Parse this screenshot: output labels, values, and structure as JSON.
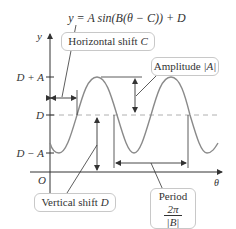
{
  "equation": "y = A sin(B(θ − C)) + D",
  "axes": {
    "y_label": "y",
    "x_label": "θ",
    "origin_label": "O",
    "ticks": [
      {
        "label": "D + A",
        "level": "max"
      },
      {
        "label": "D",
        "level": "midline"
      },
      {
        "label": "D − A",
        "level": "min"
      }
    ]
  },
  "callouts": {
    "horizontal_shift": {
      "text": "Horizontal shift ",
      "var": "C"
    },
    "amplitude": {
      "text": "Amplitude ",
      "var": "|A|"
    },
    "vertical_shift": {
      "text": "Vertical shift ",
      "var": "D"
    },
    "period": {
      "text": "Period",
      "numerator": "2π",
      "denominator": "|B|"
    }
  },
  "colors": {
    "curve": "#8a8a8a",
    "axis": "#333333",
    "midline": "#b0b0b0",
    "callout_border": "#c8c8c8"
  }
}
